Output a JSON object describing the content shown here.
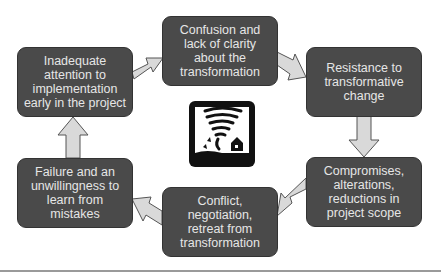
{
  "diagram": {
    "type": "cycle",
    "nodes": [
      {
        "id": "inadequate",
        "label": "Inadequate attention to implementation early in the project"
      },
      {
        "id": "confusion",
        "label": "Confusion and lack of clarity about the transformation"
      },
      {
        "id": "resistance",
        "label": "Resistance to transformative change"
      },
      {
        "id": "compromises",
        "label": "Compromises, alterations, reductions in project scope"
      },
      {
        "id": "conflict",
        "label": "Conflict, negotiation, retreat from transformation"
      },
      {
        "id": "failure",
        "label": "Failure and an unwillingness to learn from mistakes"
      }
    ],
    "edges": [
      {
        "from": "inadequate",
        "to": "confusion"
      },
      {
        "from": "confusion",
        "to": "resistance"
      },
      {
        "from": "resistance",
        "to": "compromises"
      },
      {
        "from": "compromises",
        "to": "conflict"
      },
      {
        "from": "conflict",
        "to": "failure"
      },
      {
        "from": "failure",
        "to": "inadequate"
      }
    ],
    "center_icon": "tornado-icon",
    "colors": {
      "box_fill": "#4a4a4a",
      "box_text": "#e6e6e6",
      "arrow_fill": "#d9d9d9",
      "arrow_stroke": "#555555"
    }
  }
}
